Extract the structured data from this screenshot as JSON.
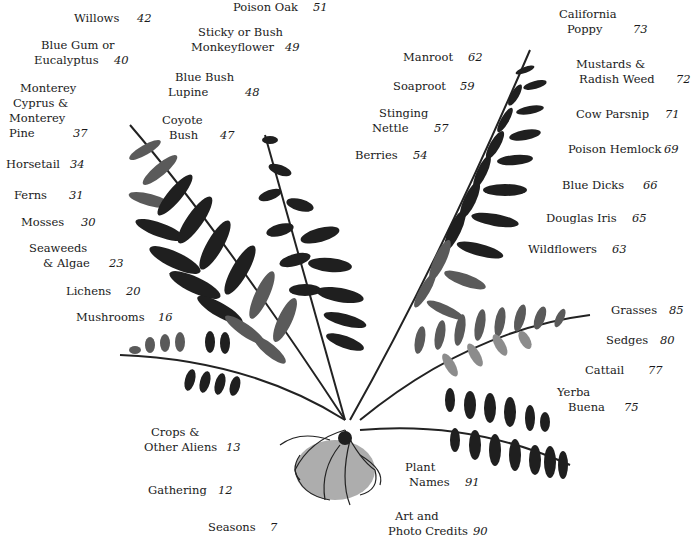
{
  "illustration": {
    "subject": "fern-print",
    "color": "#1f1f1f"
  },
  "entries": [
    {
      "name": "Poison Oak",
      "page": "51"
    },
    {
      "name": "Willows",
      "page": "42"
    },
    {
      "name": "Sticky or Bush Monkeyflower",
      "line1": "Sticky or Bush",
      "line2": "Monkeyflower",
      "page": "49"
    },
    {
      "name": "Blue Gum or Eucalyptus",
      "line1": "Blue Gum or",
      "line2": "Eucalyptus",
      "page": "40"
    },
    {
      "name": "Blue Bush Lupine",
      "line1": "Blue Bush",
      "line2": "Lupine",
      "page": "48"
    },
    {
      "name": "Monterey Cyprus & Monterey Pine",
      "line1": "Monterey",
      "line2": "Cyprus &",
      "line3": "Monterey",
      "line4": "Pine",
      "page": "37"
    },
    {
      "name": "Coyote Bush",
      "line1": "Coyote",
      "line2": "Bush",
      "page": "47"
    },
    {
      "name": "Horsetail",
      "page": "34"
    },
    {
      "name": "Ferns",
      "page": "31"
    },
    {
      "name": "Mosses",
      "page": "30"
    },
    {
      "name": "Seaweeds & Algae",
      "line1": "Seaweeds",
      "line2": "& Algae",
      "page": "23"
    },
    {
      "name": "Lichens",
      "page": "20"
    },
    {
      "name": "Mushrooms",
      "page": "16"
    },
    {
      "name": "Crops & Other Aliens",
      "line1": "Crops &",
      "line2": "Other Aliens",
      "page": "13"
    },
    {
      "name": "Gathering",
      "page": "12"
    },
    {
      "name": "Seasons",
      "page": "7"
    },
    {
      "name": "Manroot",
      "page": "62"
    },
    {
      "name": "Soaproot",
      "page": "59"
    },
    {
      "name": "Stinging Nettle",
      "line1": "Stinging",
      "line2": "Nettle",
      "page": "57"
    },
    {
      "name": "Berries",
      "page": "54"
    },
    {
      "name": "California Poppy",
      "line1": "California",
      "line2": "Poppy",
      "page": "73"
    },
    {
      "name": "Mustards & Radish Weed",
      "line1": "Mustards &",
      "line2": "Radish Weed",
      "page": "72"
    },
    {
      "name": "Cow Parsnip",
      "page": "71"
    },
    {
      "name": "Poison Hemlock",
      "page": "69"
    },
    {
      "name": "Blue Dicks",
      "page": "66"
    },
    {
      "name": "Douglas Iris",
      "page": "65"
    },
    {
      "name": "Wildflowers",
      "page": "63"
    },
    {
      "name": "Grasses",
      "page": "85"
    },
    {
      "name": "Sedges",
      "page": "80"
    },
    {
      "name": "Cattail",
      "page": "77"
    },
    {
      "name": "Yerba Buena",
      "line1": "Yerba",
      "line2": "Buena",
      "page": "75"
    },
    {
      "name": "Plant Names",
      "line1": "Plant",
      "line2": "Names",
      "page": "91"
    },
    {
      "name": "Art and Photo Credits",
      "line1": "Art and",
      "line2": "Photo Credits",
      "page": "90"
    }
  ]
}
